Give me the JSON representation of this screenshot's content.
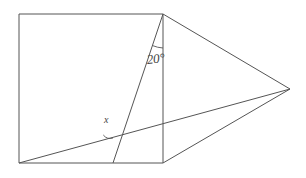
{
  "figure": {
    "canvas": {
      "width": 306,
      "height": 178,
      "background": "#ffffff"
    },
    "stroke_color": "#555555",
    "label_color": "#444444",
    "points": {
      "square_top_left": {
        "name": "A",
        "x": 19,
        "y": 14
      },
      "square_top_right": {
        "name": "B",
        "x": 163,
        "y": 14
      },
      "square_bottom_right": {
        "name": "C",
        "x": 163,
        "y": 163
      },
      "square_bottom_left": {
        "name": "D",
        "x": 19,
        "y": 163
      },
      "right_apex": {
        "name": "E",
        "x": 290,
        "y": 89
      },
      "cevian_foot": {
        "name": "F",
        "x": 113,
        "y": 163
      },
      "crossing": {
        "name": "P",
        "x": 110,
        "y": 133
      }
    },
    "segments": [
      {
        "name": "square-top-edge",
        "from": "square_top_left",
        "to": "square_top_right"
      },
      {
        "name": "square-left-edge",
        "from": "square_top_left",
        "to": "square_bottom_left"
      },
      {
        "name": "square-bottom-edge",
        "from": "square_bottom_left",
        "to": "square_bottom_right"
      },
      {
        "name": "square-right-edge",
        "from": "square_top_right",
        "to": "square_bottom_right"
      },
      {
        "name": "cevian-from-apex",
        "from": "square_top_right",
        "to": "cevian_foot"
      },
      {
        "name": "diagonal-to-vertex",
        "from": "square_bottom_left",
        "to": "right_apex"
      },
      {
        "name": "upper-triangle-edge",
        "from": "square_top_right",
        "to": "right_apex"
      },
      {
        "name": "lower-triangle-edge",
        "from": "square_bottom_right",
        "to": "right_apex"
      }
    ],
    "angles": [
      {
        "name": "angle-twenty",
        "label": "20°",
        "value": 20,
        "unit": "degrees",
        "vertex": "square_top_right",
        "between": [
          "cevian-from-apex",
          "square-right-edge"
        ]
      },
      {
        "name": "angle-x",
        "label": "x",
        "value": null,
        "unit": "degrees",
        "vertex": "crossing",
        "between": [
          "diagonal-to-vertex",
          "cevian-from-apex"
        ]
      }
    ]
  }
}
